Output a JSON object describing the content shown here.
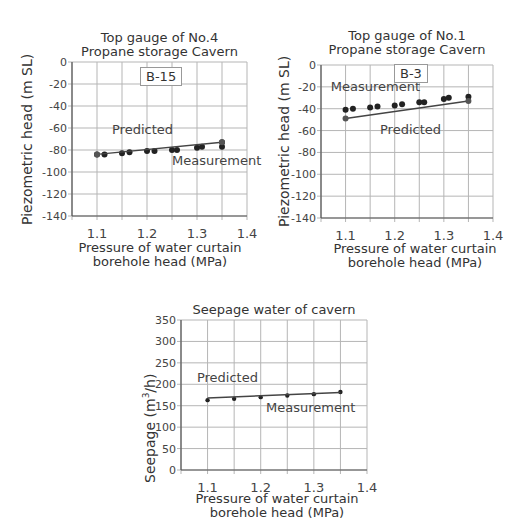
{
  "chart_data": [
    {
      "type": "scatter",
      "title": "Top gauge of No.4\nPropane storage Cavern",
      "title_lines": [
        "Top gauge of No.4",
        "Propane storage Cavern"
      ],
      "box_label": "B-15",
      "xlabel_lines": [
        "Pressure of water curtain",
        "borehole head (MPa)"
      ],
      "ylabel": "Piezometric head (m SL)",
      "xlim": [
        1.05,
        1.4
      ],
      "ylim": [
        -140,
        0
      ],
      "xticks": [
        "1.1",
        "1.2",
        "1.3",
        "1.4"
      ],
      "yticks": [
        "0",
        "-20",
        "-40",
        "-60",
        "-80",
        "-100",
        "-120",
        "-140"
      ],
      "grid": true,
      "annotations": [
        {
          "text": "Predicted",
          "x": 1.13,
          "y": -65
        },
        {
          "text": "Measurement",
          "x": 1.25,
          "y": -94
        }
      ],
      "series": [
        {
          "name": "Measurement",
          "kind": "points",
          "x": [
            1.1,
            1.115,
            1.15,
            1.165,
            1.2,
            1.215,
            1.25,
            1.26,
            1.3,
            1.31,
            1.35,
            1.35
          ],
          "y": [
            -84,
            -84,
            -83,
            -82,
            -81,
            -81,
            -80,
            -80,
            -78,
            -77,
            -77,
            -73
          ]
        },
        {
          "name": "Predicted",
          "kind": "line",
          "x": [
            1.1,
            1.35
          ],
          "y": [
            -84,
            -73
          ]
        }
      ]
    },
    {
      "type": "scatter",
      "title": "Top gauge of No.1\nPropane storage Cavern",
      "title_lines": [
        "Top gauge of No.1",
        "Propane storage Cavern"
      ],
      "box_label": "B-3",
      "xlabel_lines": [
        "Pressure of water curtain",
        "borehole head (MPa)"
      ],
      "ylabel": "Piezometric head (m SL)",
      "xlim": [
        1.05,
        1.4
      ],
      "ylim": [
        -140,
        0
      ],
      "xticks": [
        "1.1",
        "1.2",
        "1.3",
        "1.4"
      ],
      "yticks": [
        "0",
        "-20",
        "-40",
        "-60",
        "-80",
        "-100",
        "-120",
        "-140"
      ],
      "grid": true,
      "annotations": [
        {
          "text": "Measurement",
          "x": 1.07,
          "y": -24
        },
        {
          "text": "Predicted",
          "x": 1.17,
          "y": -63
        }
      ],
      "series": [
        {
          "name": "Measurement",
          "kind": "points",
          "x": [
            1.1,
            1.115,
            1.15,
            1.165,
            1.2,
            1.215,
            1.25,
            1.26,
            1.3,
            1.31,
            1.35
          ],
          "y": [
            -41,
            -40,
            -39,
            -38,
            -37,
            -36,
            -34,
            -34,
            -31,
            -30,
            -29
          ]
        },
        {
          "name": "Predicted",
          "kind": "line",
          "x": [
            1.1,
            1.35
          ],
          "y": [
            -49,
            -33
          ]
        }
      ]
    },
    {
      "type": "line",
      "title": "Seepage water of cavern",
      "title_lines": [
        "Seepage water of cavern"
      ],
      "xlabel_lines": [
        "Pressure of water curtain",
        "borehole head (MPa)"
      ],
      "ylabel": "Seepage (m3/h)",
      "ylabel_main": "Seepage (m",
      "ylabel_sup": "3",
      "ylabel_tail": "/h)",
      "xlim": [
        1.05,
        1.4
      ],
      "ylim": [
        0,
        350
      ],
      "xticks": [
        "1.1",
        "1.2",
        "1.3",
        "1.4"
      ],
      "yticks": [
        "350",
        "300",
        "250",
        "200",
        "150",
        "100",
        "50",
        "0"
      ],
      "grid": true,
      "annotations": [
        {
          "text": "Predicted",
          "x": 1.08,
          "y": 205
        },
        {
          "text": "Measurement",
          "x": 1.21,
          "y": 135
        }
      ],
      "series": [
        {
          "name": "Measurement",
          "kind": "points",
          "x": [
            1.1,
            1.15,
            1.2,
            1.25,
            1.3,
            1.35
          ],
          "y": [
            163,
            166,
            170,
            174,
            177,
            182
          ]
        },
        {
          "name": "Predicted",
          "kind": "line",
          "x": [
            1.1,
            1.35
          ],
          "y": [
            168,
            181
          ]
        }
      ]
    }
  ],
  "colors": {
    "grid": "#b5b5b5",
    "axis": "#555555",
    "line": "#444444",
    "point": "#222222"
  }
}
